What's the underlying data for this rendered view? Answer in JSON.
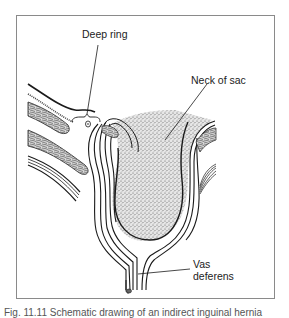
{
  "diagram": {
    "type": "anatomical-illustration",
    "labels": {
      "deep_ring": "Deep ring",
      "neck_of_sac": "Neck of sac",
      "vas_deferens_line1": "Vas",
      "vas_deferens_line2": "deferens"
    },
    "colors": {
      "line": "#1a1a1a",
      "frame": "#8a8a8a",
      "stipple": "#9a9a9a",
      "background": "#ffffff"
    },
    "caption_truncated": "Fig. 11.11  Schematic drawing of an indirect inguinal hernia"
  }
}
